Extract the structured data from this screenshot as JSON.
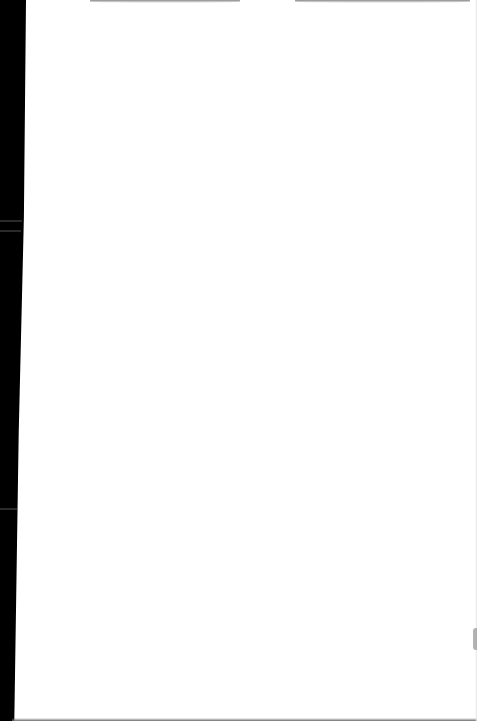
{
  "document": {
    "type": "scanned-page",
    "content": "",
    "colors": {
      "page": "#ffffff",
      "binding": "#000000",
      "shadow": "#8a8a8a",
      "smudge": "#9a9a9a"
    }
  }
}
